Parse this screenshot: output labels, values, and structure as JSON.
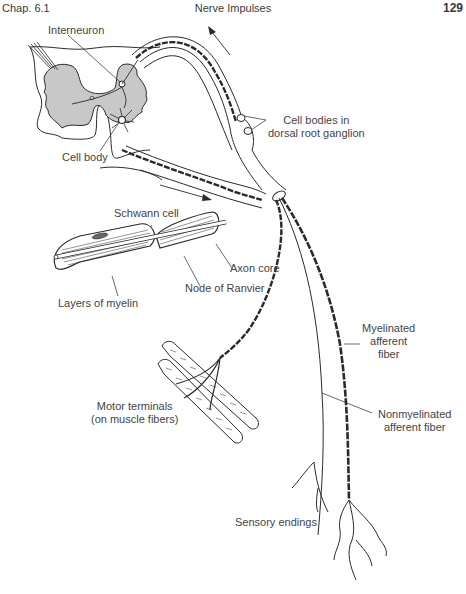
{
  "header": {
    "chapter": "Chap. 6.1",
    "title": "Nerve Impulses",
    "page_number": "129"
  },
  "figure": {
    "labels": {
      "interneuron": "Interneuron",
      "cell_body": "Cell body",
      "cell_bodies_line1": "Cell bodies in",
      "cell_bodies_line2": "dorsal root ganglion",
      "schwann_cell": "Schwann cell",
      "axon_core": "Axon core",
      "node_of_ranvier": "Node of Ranvier",
      "layers_of_myelin": "Layers of myelin",
      "motor_terminals_line1": "Motor terminals",
      "motor_terminals_line2": "(on muscle fibers)",
      "myelinated_line1": "Myelinated",
      "myelinated_line2": "afferent",
      "myelinated_line3": "fiber",
      "nonmyelinated_line1": "Nonmyelinated",
      "nonmyelinated_line2": "afferent fiber",
      "sensory_endings": "Sensory endings"
    },
    "colors": {
      "gray_matter": "#c8c8c8",
      "ink": "#2a2a2a",
      "label": "#444444"
    }
  }
}
